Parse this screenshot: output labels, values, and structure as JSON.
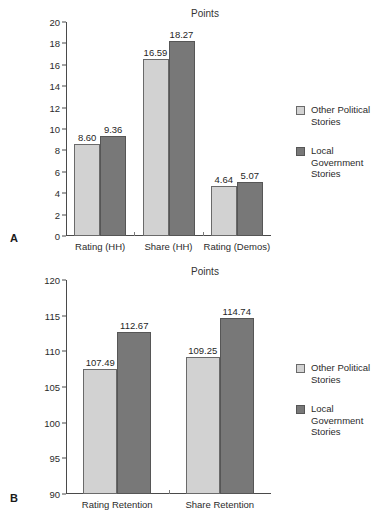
{
  "figure": {
    "series_colors": {
      "other_political": "#d2d2d2",
      "local_government": "#787878"
    },
    "legend": [
      {
        "key": "other_political",
        "label": "Other Political Stories",
        "swatch": "light"
      },
      {
        "key": "local_government",
        "label": "Local Government Stories",
        "swatch": "dark"
      }
    ]
  },
  "panel_a": {
    "letter": "A",
    "title": "Points",
    "legend_label_1": "Other Political Stories",
    "legend_label_2": "Local Government Stories",
    "yticks": [
      "0",
      "2",
      "4",
      "6",
      "8",
      "10",
      "12",
      "14",
      "16",
      "18",
      "20"
    ],
    "xlabels": [
      "Rating (HH)",
      "Share (HH)",
      "Rating (Demos)"
    ],
    "values": {
      "other_political": [
        "8.60",
        "16.59",
        "4.64"
      ],
      "local_government": [
        "9.36",
        "18.27",
        "5.07"
      ]
    }
  },
  "panel_b": {
    "letter": "B",
    "title": "Points",
    "legend_label_1": "Other Political Stories",
    "legend_label_2": "Local Government Stories",
    "yticks": [
      "90",
      "95",
      "100",
      "105",
      "110",
      "115",
      "120"
    ],
    "xlabels": [
      "Rating Retention",
      "Share Retention"
    ],
    "values": {
      "other_political": [
        "107.49",
        "109.25"
      ],
      "local_government": [
        "112.67",
        "114.74"
      ]
    }
  },
  "chart_data": [
    {
      "type": "bar",
      "panel": "A",
      "title": "Points",
      "xlabel": "",
      "ylabel": "Points",
      "ylim": [
        0,
        20
      ],
      "ytick_step": 2,
      "grid": false,
      "legend_position": "right",
      "categories": [
        "Rating (HH)",
        "Share (HH)",
        "Rating (Demos)"
      ],
      "series": [
        {
          "name": "Other Political Stories",
          "color": "#d2d2d2",
          "values": [
            8.6,
            16.59,
            4.64
          ]
        },
        {
          "name": "Local Government Stories",
          "color": "#787878",
          "values": [
            9.36,
            18.27,
            5.07
          ]
        }
      ]
    },
    {
      "type": "bar",
      "panel": "B",
      "title": "Points",
      "xlabel": "",
      "ylabel": "Points",
      "ylim": [
        90,
        120
      ],
      "ytick_step": 5,
      "grid": false,
      "legend_position": "right",
      "categories": [
        "Rating Retention",
        "Share Retention"
      ],
      "series": [
        {
          "name": "Other Political Stories",
          "color": "#d2d2d2",
          "values": [
            107.49,
            109.25
          ]
        },
        {
          "name": "Local Government Stories",
          "color": "#787878",
          "values": [
            112.67,
            114.74
          ]
        }
      ]
    }
  ]
}
